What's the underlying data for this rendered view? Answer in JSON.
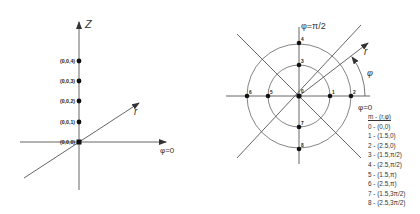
{
  "left_diagram": {
    "axes": {
      "z_label": "Z",
      "r_label": "r",
      "phi_label": "φ=0"
    },
    "points": [
      {
        "label": "(0,0,4)",
        "y": 61
      },
      {
        "label": "(0,0,3)",
        "y": 81
      },
      {
        "label": "(0,0,2)",
        "y": 101
      },
      {
        "label": "(0,0,1)",
        "y": 122
      },
      {
        "label": "(0,0,0)",
        "y": 142
      }
    ]
  },
  "right_diagram": {
    "axes": {
      "top_label": "φ=π/2",
      "r_label": "r",
      "phi_label": "φ",
      "zero_label": "φ=0"
    },
    "point_labels": [
      "0",
      "1",
      "2",
      "3",
      "4",
      "5",
      "6",
      "7",
      "8"
    ],
    "legend": {
      "header": "m - (r,φ)",
      "items": [
        "0  -  (0,0)",
        "1  -  (1.5,0)",
        "2  -  (2.5,0)",
        "3  -  (1.5,π/2)",
        "4  -  (2.5,π/2)",
        "5  -  (1.5,π)",
        "6  -  (2.5,π)",
        "7  -  (1.5,3π/2)",
        "8  -  (2.5,3π/2)"
      ]
    }
  },
  "colors": {
    "line": "#555555",
    "point": "#111111",
    "text": "#333333"
  }
}
